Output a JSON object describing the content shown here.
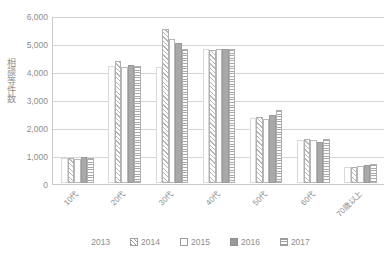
{
  "chart_data": {
    "type": "bar",
    "title": "",
    "subtitle": "",
    "xlabel": "",
    "ylabel": "相談等件数",
    "ylim": [
      0,
      6000
    ],
    "ytick_step": 1000,
    "ytick_labels": [
      "6,000",
      "5,000",
      "4,000",
      "3,000",
      "2,000",
      "1,000",
      "0"
    ],
    "ytick_values": [
      6000,
      5000,
      4000,
      3000,
      2000,
      1000,
      0
    ],
    "grid": true,
    "grid_axis": "y",
    "legend_position": "bottom-center",
    "categories": [
      "10代",
      "20代",
      "30代",
      "40代",
      "50代",
      "60代",
      "70歳以上"
    ],
    "series": [
      {
        "name": "2013",
        "fill": "white",
        "values": [
          880,
          4180,
          4150,
          4780,
          2330,
          1520,
          560
        ]
      },
      {
        "name": "2014",
        "fill": "diagonal-hatch",
        "values": [
          900,
          4350,
          5500,
          4760,
          2350,
          1560,
          580
        ]
      },
      {
        "name": "2015",
        "fill": "white-outline",
        "values": [
          870,
          4150,
          5150,
          4800,
          2300,
          1530,
          620
        ]
      },
      {
        "name": "2016",
        "fill": "solid-gray",
        "values": [
          920,
          4230,
          5000,
          4790,
          2420,
          1450,
          640
        ]
      },
      {
        "name": "2017",
        "fill": "horizontal-lines",
        "values": [
          900,
          4180,
          4800,
          4800,
          2600,
          1560,
          690
        ]
      }
    ]
  },
  "legend": {
    "items": [
      {
        "label": "2013",
        "swatch": "white-swatch-icon"
      },
      {
        "label": "2014",
        "swatch": "diagonal-hatch-swatch-icon"
      },
      {
        "label": "2015",
        "swatch": "outline-swatch-icon"
      },
      {
        "label": "2016",
        "swatch": "solid-gray-swatch-icon"
      },
      {
        "label": "2017",
        "swatch": "horizontal-lines-swatch-icon"
      }
    ]
  },
  "colors": {
    "axis": "#c9c9c9",
    "gridline": "#d6d6d6",
    "text": "#8d8d8d",
    "solid_series": "#a9a9a9",
    "hatch_stroke": "#b0b0b0",
    "background": "#ffffff"
  }
}
